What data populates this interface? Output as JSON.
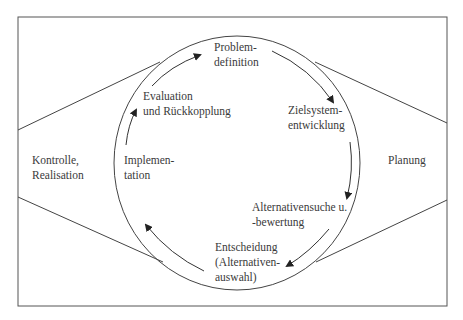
{
  "diagram": {
    "left_region": {
      "line1": "Kontrolle,",
      "line2": "Realisation"
    },
    "right_region": {
      "label": "Planung"
    },
    "cycle": {
      "problem": {
        "line1": "Problem-",
        "line2": "definition"
      },
      "ziel": {
        "line1": "Zielsystem-",
        "line2": "entwicklung"
      },
      "alternativen": {
        "line1": "Alternativensuche u.",
        "line2": "-bewertung"
      },
      "entscheidung": {
        "line1": "Entscheidung",
        "line2": "(Alternativen-",
        "line3": "auswahl)"
      },
      "implementation": {
        "line1": "Implemen-",
        "line2": "tation"
      },
      "evaluation": {
        "line1": "Evaluation",
        "line2": "und Rückkopplung"
      }
    }
  }
}
